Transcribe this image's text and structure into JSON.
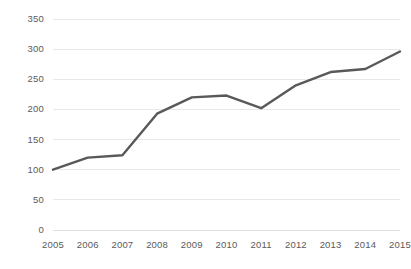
{
  "chart_data": {
    "type": "line",
    "title": "",
    "subtitle": "",
    "xlabel": "",
    "ylabel": "",
    "categories": [
      "2005",
      "2006",
      "2007",
      "2008",
      "2009",
      "2010",
      "2011",
      "2012",
      "2013",
      "2014",
      "2015"
    ],
    "series": [
      {
        "name": "",
        "values": [
          100,
          120,
          124,
          193,
          220,
          223,
          202,
          240,
          262,
          267,
          296
        ],
        "color": "#595959",
        "line_width": 2.4,
        "markers": false
      }
    ],
    "ylim": [
      0,
      350
    ],
    "yticks": [
      0,
      50,
      100,
      150,
      200,
      250,
      300,
      350
    ],
    "ytick_labels": [
      "0",
      "50",
      "100",
      "150",
      "200",
      "250",
      "300",
      "350"
    ],
    "xtick_labels": [
      "2005",
      "2006",
      "2007",
      "2008",
      "2009",
      "2010",
      "2011",
      "2012",
      "2013",
      "2014",
      "2015"
    ],
    "grid": {
      "horizontal": true,
      "vertical": false,
      "color": "#e8e8e8"
    },
    "legend": {
      "visible": false,
      "position": "none",
      "entries": []
    },
    "axis": {
      "y_label_color": "#5a5a5a",
      "x_label_color": "#5a5a5a",
      "spine_visible": false
    },
    "plot_area": {
      "left": 53,
      "right": 400,
      "top": 19,
      "bottom": 230
    },
    "background": "#ffffff"
  }
}
